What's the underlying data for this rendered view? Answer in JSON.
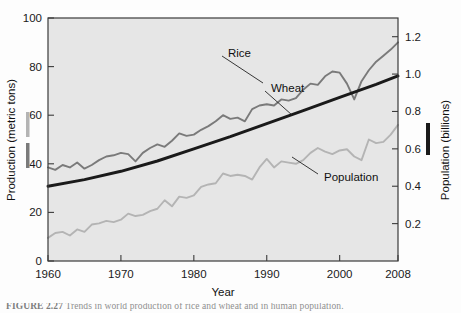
{
  "figure": {
    "caption_label": "FIGURE 2.27",
    "caption_text": "Trends in world production of rice and wheat and in human population."
  },
  "chart_data": {
    "type": "line",
    "title": "",
    "xlabel": "Year",
    "ylabel": "Production (metric tons)",
    "ylabel_right": "Population (billions)",
    "xlim": [
      1960,
      2008
    ],
    "ylim": [
      0,
      100
    ],
    "ylim_right": [
      0.0,
      1.3
    ],
    "xticks": [
      1960,
      1970,
      1980,
      1990,
      2000,
      2008
    ],
    "xtick_labels": [
      "1960",
      "1970",
      "1980",
      "1990",
      "2000",
      "2008"
    ],
    "yticks": [
      0,
      20,
      40,
      60,
      80,
      100
    ],
    "ytick_labels": [
      "0",
      "20",
      "40",
      "60",
      "80",
      "100"
    ],
    "yticks_right": [
      0.2,
      0.4,
      0.6,
      0.8,
      1.0,
      1.2
    ],
    "ytick_labels_right": [
      "0.2",
      "0.4",
      "0.6",
      "0.8",
      "1.0",
      "1.2"
    ],
    "grid": false,
    "legend": "inline-annotations",
    "colors": {
      "rice": "#7a7a7a",
      "wheat": "#b4b4b4",
      "population": "#1a1a1a",
      "plot_background": "#e6e6e6",
      "frame": "#3b3b3b"
    },
    "annotations": [
      {
        "text": "Rice",
        "series": "rice",
        "x": 1990,
        "y": 88
      },
      {
        "text": "Wheat",
        "series": "wheat",
        "x": 1993,
        "y": 72
      },
      {
        "text": "Population",
        "series": "population",
        "x": 1997,
        "y": 41
      }
    ],
    "series": [
      {
        "name": "Rice",
        "axis": "left",
        "unit": "metric tons",
        "color": "#7a7a7a",
        "x": [
          1960,
          1961,
          1962,
          1963,
          1964,
          1965,
          1966,
          1967,
          1968,
          1969,
          1970,
          1971,
          1972,
          1973,
          1974,
          1975,
          1976,
          1977,
          1978,
          1979,
          1980,
          1981,
          1982,
          1983,
          1984,
          1985,
          1986,
          1987,
          1988,
          1989,
          1990,
          1991,
          1992,
          1993,
          1994,
          1995,
          1996,
          1997,
          1998,
          1999,
          2000,
          2001,
          2002,
          2003,
          2004,
          2005,
          2006,
          2007,
          2008
        ],
        "values": [
          38.5,
          37.5,
          39.5,
          38.5,
          40.5,
          38.0,
          39.5,
          41.5,
          43.0,
          43.5,
          44.5,
          44.0,
          41.0,
          44.5,
          46.5,
          48.0,
          47.0,
          49.5,
          52.5,
          51.5,
          52.0,
          54.0,
          55.5,
          57.5,
          60.0,
          58.5,
          59.0,
          57.5,
          62.5,
          64.0,
          64.5,
          64.0,
          66.5,
          66.0,
          67.0,
          70.5,
          73.0,
          72.5,
          76.0,
          78.0,
          77.5,
          73.0,
          66.5,
          74.0,
          78.5,
          82.0,
          84.5,
          87.0,
          90.0
        ]
      },
      {
        "name": "Wheat",
        "axis": "left",
        "unit": "metric tons",
        "color": "#b4b4b4",
        "x": [
          1960,
          1961,
          1962,
          1963,
          1964,
          1965,
          1966,
          1967,
          1968,
          1969,
          1970,
          1971,
          1972,
          1973,
          1974,
          1975,
          1976,
          1977,
          1978,
          1979,
          1980,
          1981,
          1982,
          1983,
          1984,
          1985,
          1986,
          1987,
          1988,
          1989,
          1990,
          1991,
          1992,
          1993,
          1994,
          1995,
          1996,
          1997,
          1998,
          1999,
          2000,
          2001,
          2002,
          2003,
          2004,
          2005,
          2006,
          2007,
          2008
        ],
        "values": [
          9.5,
          11.5,
          12.0,
          10.5,
          13.0,
          12.0,
          15.0,
          15.5,
          16.5,
          16.0,
          17.0,
          19.5,
          18.5,
          19.0,
          20.5,
          21.5,
          25.0,
          22.5,
          26.5,
          26.0,
          27.0,
          30.5,
          31.5,
          32.0,
          36.0,
          35.0,
          35.5,
          35.0,
          33.5,
          38.5,
          42.0,
          38.5,
          41.0,
          40.5,
          40.0,
          41.5,
          44.5,
          46.5,
          45.0,
          44.0,
          45.5,
          46.0,
          43.0,
          41.5,
          50.0,
          48.5,
          49.0,
          52.0,
          56.0
        ]
      },
      {
        "name": "Population",
        "axis": "right",
        "unit": "billions",
        "color": "#1a1a1a",
        "x": [
          1960,
          1965,
          1970,
          1975,
          1980,
          1985,
          1990,
          1995,
          2000,
          2005,
          2008
        ],
        "values": [
          0.4,
          0.435,
          0.48,
          0.535,
          0.6,
          0.665,
          0.735,
          0.805,
          0.875,
          0.945,
          0.99
        ]
      }
    ]
  }
}
